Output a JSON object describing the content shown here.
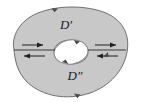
{
  "figure": {
    "width": 143,
    "height": 102,
    "background_color": "#ffffff"
  },
  "colors": {
    "region_fill": "#c8c8c8",
    "region_stroke": "#6e6e6e",
    "hole_fill": "#ffffff",
    "hole_stroke": "#8a8a8a",
    "arrow_color": "#1f1f1f",
    "boundary_arrow_color": "#4a4a4a",
    "label_color": "#1a1a1a"
  },
  "labels": {
    "upper_region": "D′",
    "lower_region": "D″"
  },
  "label_positions": {
    "upper_region": {
      "x": 66,
      "y": 29
    },
    "lower_region": {
      "x": 75,
      "y": 80
    }
  },
  "cut_segments": [
    {
      "name": "left-cut",
      "x1": 14,
      "y1": 50,
      "x2": 55,
      "y2": 50
    },
    {
      "name": "right-cut",
      "x1": 88,
      "y1": 50,
      "x2": 126,
      "y2": 50
    }
  ],
  "flow_arrows": [
    {
      "name": "left-upper-arrow",
      "direction": "right",
      "x1": 22,
      "y1": 45,
      "x2": 45,
      "y2": 45
    },
    {
      "name": "left-lower-arrow",
      "direction": "left",
      "x1": 45,
      "y1": 56,
      "x2": 22,
      "y2": 56
    },
    {
      "name": "right-upper-arrow",
      "direction": "right",
      "x1": 95,
      "y1": 45,
      "x2": 118,
      "y2": 45
    },
    {
      "name": "right-lower-arrow",
      "direction": "left",
      "x1": 118,
      "y1": 56,
      "x2": 95,
      "y2": 56
    }
  ],
  "boundary_orientation_marks": [
    {
      "name": "outer-top-arrowhead",
      "x": 54,
      "y": 10,
      "direction": "right"
    },
    {
      "name": "outer-right-arrowhead",
      "x": 106,
      "y": 55,
      "direction": "left"
    },
    {
      "name": "outer-bottom-arrowhead",
      "x": 78,
      "y": 93,
      "direction": "left"
    },
    {
      "name": "hole-top-arrowhead",
      "x": 76,
      "y": 43,
      "direction": "right"
    },
    {
      "name": "hole-bottom-arrowhead",
      "x": 66,
      "y": 63,
      "direction": "left"
    }
  ],
  "geometry": {
    "outer_blob_path": "M 14 50 C 11 36 20 20 38 13 C 58 5 86 5 106 13 C 124 21 130 36 127 52 C 124 70 110 86 90 93 C 66 101 42 96 27 82 C 17 72 15 60 14 50 Z",
    "hole_ellipse": {
      "cx": 71,
      "cy": 52,
      "rx": 17,
      "ry": 12,
      "rotation": -8
    }
  }
}
